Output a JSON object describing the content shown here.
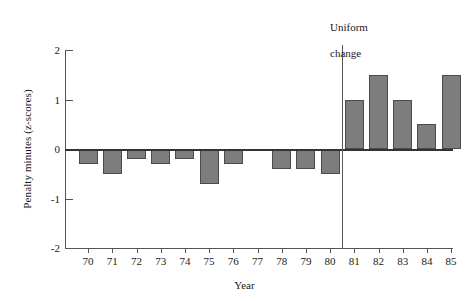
{
  "chart_data": {
    "type": "bar",
    "title": "",
    "xlabel": "Year",
    "ylabel": "Penalty minutes (z-scores)",
    "ylim": [
      -2,
      2
    ],
    "yticks": [
      2,
      1,
      0,
      -1,
      -2
    ],
    "ytick_labels": [
      "2",
      "1",
      "0",
      "-1",
      "-2"
    ],
    "grid": false,
    "legend": null,
    "categories": [
      "70",
      "71",
      "72",
      "73",
      "74",
      "75",
      "76",
      "77",
      "78",
      "79",
      "80",
      "81",
      "82",
      "83",
      "84",
      "85"
    ],
    "values": [
      -0.3,
      -0.5,
      -0.2,
      -0.3,
      -0.2,
      -0.7,
      -0.3,
      -0.05,
      -0.4,
      -0.4,
      -0.5,
      1.0,
      1.5,
      1.0,
      0.5,
      1.5
    ],
    "bar_color": "#7d7d7d",
    "bar_edge_color": "#4a4a4a",
    "annotations": [
      {
        "name": "uniform-change",
        "text": "Uniform\nchange",
        "line_1": "Uniform",
        "line_2": "change",
        "at_x_between": [
          "80",
          "81"
        ],
        "type": "vertical-line-with-label"
      }
    ]
  }
}
